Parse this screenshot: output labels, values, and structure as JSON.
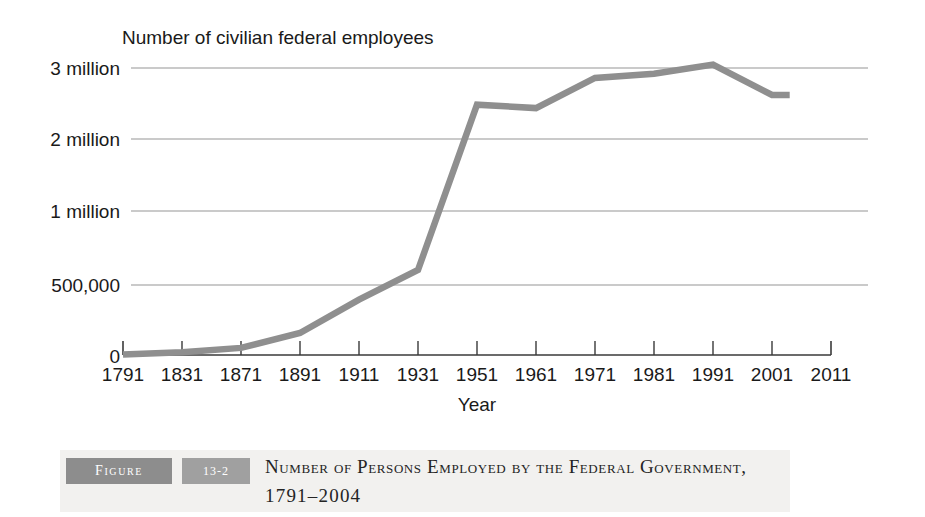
{
  "chart_data": {
    "type": "line",
    "title": "Number of civilian federal employees",
    "xlabel": "Year",
    "ylabel": "",
    "grid": true,
    "legend": "none",
    "x_tick_labels": [
      "1791",
      "1831",
      "1871",
      "1891",
      "1911",
      "1931",
      "1951",
      "1961",
      "1971",
      "1981",
      "1991",
      "2001",
      "2011"
    ],
    "y_tick_labels": [
      "3 million",
      "2 million",
      "1 million",
      "500,000",
      "0"
    ],
    "y_tick_values": [
      3000000,
      2000000,
      1000000,
      500000,
      0
    ],
    "x": [
      1791,
      1831,
      1871,
      1891,
      1911,
      1931,
      1951,
      1961,
      1971,
      1981,
      1991,
      2001,
      2004
    ],
    "values": [
      4479,
      20000,
      51000,
      157442,
      395905,
      601319,
      2482666,
      2435804,
      2860000,
      2920000,
      3048000,
      2620000,
      2620000
    ],
    "series": [
      {
        "name": "Civilian federal employees",
        "color": "#8f8f8f",
        "values": [
          4479,
          20000,
          51000,
          157442,
          395905,
          601319,
          2482666,
          2435804,
          2860000,
          2920000,
          3048000,
          2620000,
          2620000
        ]
      }
    ],
    "xlim": [
      1791,
      2011
    ],
    "ylim": [
      0,
      3200000
    ],
    "note": "Vertical scale is compressed below 500,000"
  },
  "caption": {
    "figure_word": "Figure",
    "figure_number": "13-2",
    "line1": "Number of Persons Employed by the Federal Government,",
    "line2": "1791–2004"
  },
  "colors": {
    "line": "#8f8f8f",
    "grid": "#b9b9b9",
    "axis": "#3a3a3a",
    "caption_band": "#f2f1ef",
    "badge_dark": "#8d8d8d",
    "badge_light": "#a0a0a0"
  }
}
